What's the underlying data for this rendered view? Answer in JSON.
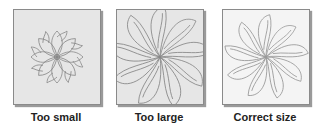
{
  "panels": [
    {
      "label": "Too small",
      "background": "#e6e6e6",
      "motif": "small-flower"
    },
    {
      "label": "Too large",
      "background": "#e6e6e6",
      "motif": "large-swirl"
    },
    {
      "label": "Correct size",
      "background": "#f4f4f4",
      "motif": "fitted-swirl"
    }
  ],
  "colors": {
    "stroke": "#888888",
    "border": "#8a8a8a",
    "text": "#222222"
  }
}
